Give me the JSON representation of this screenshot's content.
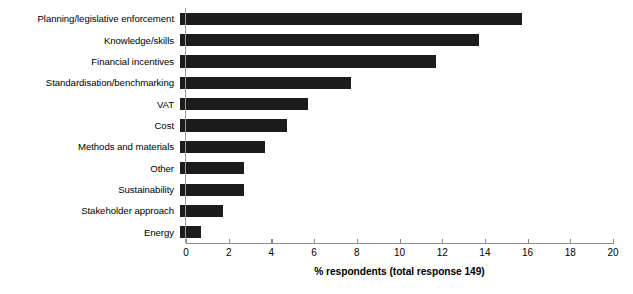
{
  "chart_data": {
    "type": "bar",
    "orientation": "horizontal",
    "title": "",
    "subtitle": "",
    "xlabel": "% respondents (total response 149)",
    "ylabel": "",
    "xlim": [
      0,
      20
    ],
    "xticks": [
      0,
      2,
      4,
      6,
      8,
      10,
      12,
      14,
      16,
      18,
      20
    ],
    "xtick_labels": [
      "0",
      "2",
      "4",
      "6",
      "8",
      "10",
      "12",
      "14",
      "16",
      "18",
      "20"
    ],
    "grid": false,
    "legend": null,
    "bar_color": "#1c1c1c",
    "background_color": "#ffffff",
    "categories": [
      "Planning/legislative enforcement",
      "Knowledge/skills",
      "Financial incentives",
      "Standardisation/benchmarking",
      "VAT",
      "Cost",
      "Methods and materials",
      "Other",
      "Sustainability",
      "Stakeholder approach",
      "Energy"
    ],
    "values": [
      16,
      14,
      12,
      8,
      6,
      5,
      4,
      3,
      3,
      2,
      1
    ],
    "annotations": []
  }
}
